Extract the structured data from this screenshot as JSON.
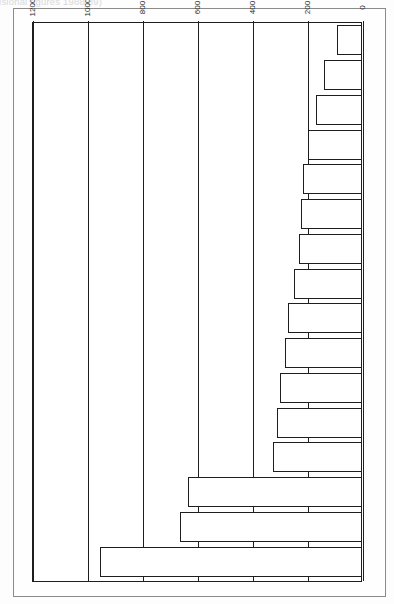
{
  "page": {
    "title_fragment": "Sectors (provisional figures 1988/89)"
  },
  "axis": {
    "ticks": [
      "0",
      "200",
      "400",
      "600",
      "800",
      "1000",
      "1200"
    ],
    "tick_values": [
      0,
      200,
      400,
      600,
      800,
      1000,
      1200
    ]
  },
  "chart_data": {
    "type": "bar",
    "orientation": "horizontal",
    "title": "Sectors (provisional figures 1988/89)",
    "xlabel": "",
    "ylabel": "",
    "ylim": [
      0,
      1200
    ],
    "grid": true,
    "legend": "none",
    "categories": [
      "Extraction of oil/gas",
      "Extraction of minerals\nand ores",
      "Coal extraction",
      "Metal manufacturing",
      "Coke ovens",
      "Mineral oil processing",
      "Construction",
      "Timber and wooden furniture",
      "Railways",
      "Manufacture of metal goods",
      "Food, drink and tobacco\nmanufacturing",
      "Man made fibres",
      "Non-metallic mineral products",
      "Forestry",
      "Rubber/plastics",
      "All industries"
    ],
    "values": [
      950,
      660,
      630,
      320,
      305,
      295,
      278,
      265,
      245,
      226,
      218,
      212,
      193,
      163,
      133,
      88
    ]
  },
  "colors": {
    "bar_fill": "#ffffff",
    "bar_stroke": "#1e1e1e",
    "grid": "#1e1e1e",
    "page_border": "#8a8a8a",
    "text": "#1a1a1a"
  }
}
